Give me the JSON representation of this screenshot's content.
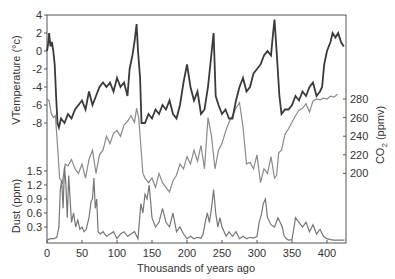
{
  "chart_data": [
    {
      "type": "line",
      "title": "",
      "xlabel": "Thousands of years ago",
      "ylabel": "VTemperature (°c)",
      "xlim": [
        0,
        427
      ],
      "ylim": [
        -8,
        4
      ],
      "x_ticks": [
        0,
        50,
        100,
        150,
        200,
        250,
        300,
        350,
        400
      ],
      "y_ticks": [
        4,
        2,
        0,
        -2,
        -4,
        -6,
        -8
      ],
      "series": [
        {
          "name": "Temperature",
          "color": "#3a3a3a",
          "x": [
            0,
            2,
            3,
            5,
            7,
            9,
            11,
            13,
            15,
            17,
            20,
            25,
            30,
            35,
            40,
            45,
            50,
            55,
            60,
            65,
            70,
            75,
            80,
            85,
            90,
            95,
            100,
            105,
            110,
            115,
            118,
            122,
            125,
            128,
            130,
            133,
            135,
            140,
            145,
            150,
            155,
            160,
            165,
            170,
            175,
            180,
            185,
            190,
            195,
            200,
            205,
            210,
            215,
            220,
            225,
            230,
            234,
            238,
            241,
            245,
            250,
            255,
            260,
            265,
            270,
            275,
            280,
            285,
            290,
            295,
            300,
            305,
            310,
            315,
            320,
            323,
            325,
            328,
            332,
            335,
            340,
            345,
            350,
            355,
            360,
            365,
            370,
            375,
            380,
            385,
            390,
            393,
            396,
            400,
            405,
            408,
            412,
            416,
            420,
            424
          ],
          "y": [
            0,
            1,
            2,
            0.5,
            1,
            0,
            -1.5,
            -5,
            -8,
            -8.5,
            -7.5,
            -8,
            -7,
            -7.5,
            -6.5,
            -6,
            -5.5,
            -6.5,
            -4.5,
            -6,
            -5,
            -4,
            -3.5,
            -4,
            -3.5,
            -4.5,
            -3,
            -4,
            -3.5,
            -5,
            -2,
            -0.5,
            1,
            3,
            0,
            -3,
            -8,
            -8,
            -7,
            -7.5,
            -6.5,
            -7,
            -6,
            -6.5,
            -5.5,
            -7,
            -7.5,
            -6,
            -3.5,
            -1.5,
            -4,
            -5.5,
            -4.5,
            -7,
            -6.5,
            -4,
            -1,
            2,
            -5,
            -6,
            -7,
            -6.5,
            -7.5,
            -7.5,
            -5.5,
            -4,
            -3,
            -4.5,
            -4,
            -2.5,
            -2,
            -1.5,
            -0.5,
            0,
            -0.5,
            2,
            3.5,
            0,
            -5,
            -7,
            -6.5,
            -6.5,
            -6,
            -5,
            -5.5,
            -4.5,
            -5,
            -4,
            -3.5,
            -5,
            -4.5,
            -4,
            -1.5,
            0,
            1,
            2,
            1.5,
            2,
            1,
            0.5
          ]
        },
        {
          "name": "CO2",
          "color": "#8a8a8a",
          "axis": "right",
          "ylabel": "CO2 (ppmv)",
          "y_ticks": [
            280,
            260,
            240,
            220,
            200
          ],
          "x": [
            0,
            3,
            6,
            9,
            12,
            15,
            18,
            22,
            26,
            30,
            35,
            40,
            45,
            50,
            55,
            60,
            65,
            70,
            75,
            80,
            85,
            90,
            95,
            100,
            105,
            110,
            115,
            120,
            125,
            128,
            131,
            134,
            137,
            140,
            145,
            150,
            155,
            160,
            165,
            170,
            175,
            180,
            185,
            190,
            195,
            200,
            205,
            210,
            215,
            220,
            225,
            230,
            235,
            240,
            245,
            250,
            255,
            260,
            265,
            270,
            275,
            280,
            285,
            290,
            295,
            300,
            305,
            310,
            315,
            320,
            325,
            328,
            331,
            335,
            340,
            345,
            350,
            355,
            360,
            365,
            370,
            375,
            380,
            385,
            390,
            395,
            400,
            405,
            410,
            415
          ],
          "y": [
            280,
            278,
            265,
            260,
            262,
            230,
            195,
            190,
            210,
            208,
            215,
            205,
            200,
            210,
            195,
            215,
            225,
            200,
            220,
            225,
            240,
            232,
            243,
            246,
            240,
            252,
            256,
            262,
            255,
            270,
            260,
            230,
            200,
            195,
            190,
            195,
            185,
            200,
            190,
            185,
            180,
            192,
            198,
            210,
            205,
            218,
            210,
            225,
            213,
            230,
            205,
            260,
            240,
            205,
            225,
            232,
            245,
            255,
            262,
            270,
            276,
            250,
            210,
            212,
            205,
            220,
            190,
            205,
            200,
            218,
            195,
            198,
            222,
            225,
            242,
            248,
            255,
            262,
            268,
            270,
            275,
            266,
            278,
            280,
            279,
            281,
            280,
            283,
            282,
            285
          ]
        },
        {
          "name": "Dust",
          "color": "#7a7a7a",
          "axis": "left-lower",
          "ylabel": "Dust (ppm)",
          "y_ticks": [
            1.5,
            1.2,
            0.9,
            0.6,
            0.3
          ],
          "x": [
            0,
            5,
            10,
            14,
            17,
            19,
            21,
            23,
            25,
            27,
            29,
            31,
            33,
            35,
            38,
            41,
            44,
            47,
            50,
            53,
            56,
            60,
            63,
            65,
            67,
            69,
            71,
            73,
            76,
            80,
            85,
            90,
            95,
            100,
            105,
            110,
            115,
            120,
            125,
            130,
            134,
            137,
            140,
            143,
            146,
            150,
            155,
            160,
            165,
            170,
            175,
            180,
            185,
            190,
            195,
            200,
            205,
            210,
            215,
            220,
            223,
            226,
            229,
            232,
            235,
            238,
            241,
            244,
            247,
            250,
            253,
            256,
            260,
            265,
            270,
            275,
            280,
            285,
            290,
            295,
            300,
            303,
            306,
            309,
            312,
            315,
            320,
            325,
            330,
            333,
            336,
            339,
            342,
            345,
            350,
            355,
            360,
            365,
            370,
            375,
            380,
            385,
            390,
            395,
            400,
            405,
            410,
            415,
            420,
            425
          ],
          "y": [
            0.02,
            0.05,
            0.05,
            0.08,
            0.3,
            1.1,
            1.3,
            0.7,
            1.6,
            1.2,
            0.5,
            1.4,
            0.9,
            0.4,
            0.6,
            0.3,
            0.45,
            0.25,
            0.3,
            0.2,
            0.25,
            0.5,
            0.85,
            0.9,
            1.35,
            0.7,
            0.9,
            0.2,
            0.15,
            0.2,
            0.1,
            0.15,
            0.2,
            0.05,
            0.15,
            0.2,
            0.1,
            0.15,
            0.2,
            0.05,
            0.8,
            0.6,
            1.0,
            0.9,
            1.2,
            0.5,
            0.3,
            0.4,
            0.7,
            0.4,
            0.3,
            0.6,
            0.2,
            0.3,
            0.15,
            0.05,
            0.1,
            0.05,
            0.08,
            0.06,
            0.15,
            0.4,
            0.6,
            0.4,
            0.7,
            1.1,
            0.6,
            0.3,
            0.5,
            0.3,
            0.2,
            0.1,
            0.2,
            0.1,
            0.2,
            0.05,
            0.1,
            0.05,
            0.08,
            0.06,
            0.1,
            0.4,
            0.55,
            0.8,
            0.9,
            0.5,
            0.35,
            0.3,
            0.5,
            0.4,
            0.3,
            0.1,
            0.05,
            0.02,
            0.03,
            0.5,
            0.4,
            0.3,
            0.4,
            0.2,
            0.35,
            0.15,
            0.25,
            0.1,
            0.05,
            0.03,
            0.02,
            0.02,
            0.02,
            0.02
          ]
        }
      ],
      "grid": false,
      "legend": "none"
    }
  ],
  "axes": {
    "left_top_label": "VTemperature (°c)",
    "left_bottom_label": "Dust (ppm)",
    "right_label_main": "CO",
    "right_label_sub": "2",
    "right_label_unit": " (ppmv)",
    "x_label": "Thousands of years ago",
    "temp_ticks": [
      "4",
      "2",
      "0",
      "-2",
      "-4",
      "-6",
      "-8"
    ],
    "dust_ticks": [
      "1.5",
      "1.2",
      "0.9",
      "0.6",
      "0.3"
    ],
    "co2_ticks": [
      "280",
      "260",
      "240",
      "220",
      "200"
    ],
    "x_ticks": [
      "0",
      "50",
      "100",
      "150",
      "200",
      "250",
      "300",
      "350",
      "400"
    ]
  }
}
